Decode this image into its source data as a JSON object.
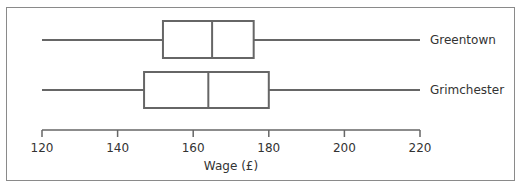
{
  "chart_data": {
    "type": "boxplot",
    "title": "",
    "xlabel": "Wage (£)",
    "ylabel": "",
    "xlim": [
      120,
      220
    ],
    "x_ticks": [
      120,
      140,
      160,
      180,
      200,
      220
    ],
    "x_tick_labels": [
      "120",
      "140",
      "160",
      "180",
      "200",
      "220"
    ],
    "grid": false,
    "legend": null,
    "series": [
      {
        "name": "Greentown",
        "min": 120,
        "q1": 152,
        "median": 165,
        "q3": 176,
        "max": 220
      },
      {
        "name": "Grimchester",
        "min": 120,
        "q1": 147,
        "median": 164,
        "q3": 180,
        "max": 220
      }
    ]
  },
  "colors": {
    "line": "#666666",
    "frame": "#8a8a8a",
    "text": "#333333",
    "background": "#ffffff"
  }
}
